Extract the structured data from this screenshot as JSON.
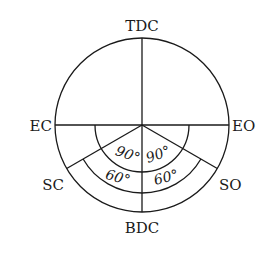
{
  "diagram": {
    "type": "valve-timing-diagram",
    "labels": {
      "top": "TDC",
      "bottom": "BDC",
      "left": "EC",
      "right": "EO",
      "lower_left": "SC",
      "lower_right": "SO"
    },
    "angles": {
      "left_inner": "90°",
      "right_inner": "90°",
      "left_outer": "60°",
      "right_outer": "60°"
    },
    "stroke_color": "#1a1a1a",
    "background_color": "#ffffff"
  }
}
